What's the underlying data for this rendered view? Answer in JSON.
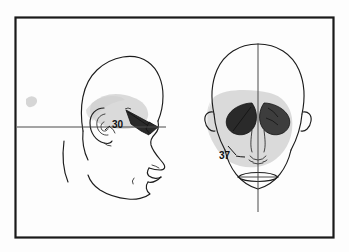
{
  "figure": {
    "background_color": "#fdfdfd",
    "frame": {
      "name": "plate-border",
      "stroke_color": "#1a1a1a",
      "stroke_width": 2.2,
      "x": 14,
      "y": 16,
      "width": 321,
      "height": 223
    },
    "ink_color": "#1c1c1c",
    "shadow_color": "#bdbdbd",
    "dark_fill_color": "#2a2a2a"
  },
  "panels": [
    {
      "id": "lateral",
      "name": "lateral-profile-view",
      "orientation": "Lateral / profile, facing right",
      "callout": {
        "label": "30",
        "x": 116,
        "y": 124,
        "color": "#101010"
      },
      "reference_line": {
        "name": "frankfort-horizontal-line",
        "type": "horizontal",
        "y": 127,
        "x_start": 17,
        "x_end": 166,
        "color": "#4a4a4a"
      },
      "features": [
        "cranial-vault-outline",
        "ear-auricle",
        "nose-profile",
        "lips-profile",
        "chin-profile",
        "mandible-border",
        "temporal-shading",
        "dark-orbital-wedge"
      ]
    },
    {
      "id": "frontal",
      "name": "anterior-frontal-view",
      "orientation": "Anterior / frontal",
      "callout": {
        "label": "37",
        "x": 224,
        "y": 156,
        "color": "#101010"
      },
      "reference_line": {
        "name": "midsagittal-vertical-line",
        "type": "vertical",
        "x": 258,
        "y_start": 44,
        "y_end": 212,
        "color": "#4a4a4a"
      },
      "features": [
        "cranial-vault-outline",
        "left-orbital-dark-region",
        "right-orbital-dark-region",
        "nasal-aperture",
        "mouth-lens",
        "mandible-outline",
        "ear-left",
        "ear-right",
        "cheek-shading"
      ]
    }
  ]
}
